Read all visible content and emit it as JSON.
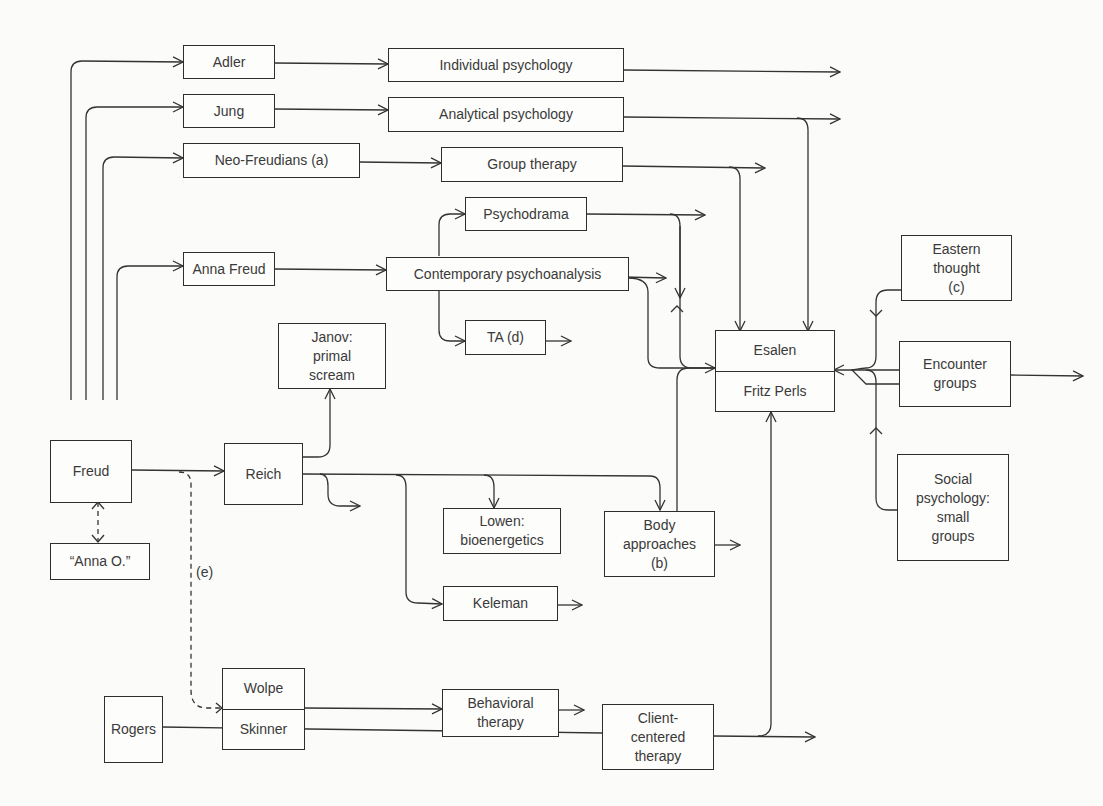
{
  "diagram": {
    "type": "flowchart",
    "nodes": {
      "adler": "Adler",
      "jung": "Jung",
      "neo_freudians": "Neo-Freudians (a)",
      "anna_freud": "Anna Freud",
      "individual_psychology": "Individual psychology",
      "analytical_psychology": "Analytical psychology",
      "group_therapy": "Group therapy",
      "psychodrama": "Psychodrama",
      "contemporary_psychoanalysis": "Contemporary psychoanalysis",
      "ta": "TA (d)",
      "janov": "Janov:\nprimal\nscream",
      "freud": "Freud",
      "anna_o": "“Anna O.”",
      "reich": "Reich",
      "lowen": "Lowen:\nbioenergetics",
      "body_approaches": "Body\napproaches\n(b)",
      "keleman": "Keleman",
      "wolpe": "Wolpe",
      "skinner": "Skinner",
      "behavioral_therapy": "Behavioral\ntherapy",
      "rogers": "Rogers",
      "client_centered": "Client-\ncentered\ntherapy",
      "esalen": "Esalen",
      "fritz_perls": "Fritz Perls",
      "eastern_thought": "Eastern\nthought\n(c)",
      "encounter_groups": "Encounter\ngroups",
      "social_psychology": "Social\npsychology:\nsmall\ngroups"
    },
    "labels": {
      "e": "(e)"
    },
    "edges": [
      {
        "from": "Freud",
        "to": "Adler"
      },
      {
        "from": "Freud",
        "to": "Jung"
      },
      {
        "from": "Freud",
        "to": "Neo-Freudians (a)"
      },
      {
        "from": "Freud",
        "to": "Anna Freud"
      },
      {
        "from": "Freud",
        "to": "Reich"
      },
      {
        "from": "Freud",
        "to": "“Anna O.”",
        "style": "dashed",
        "bidirectional": true
      },
      {
        "from": "Freud",
        "to": "Wolpe/Skinner",
        "style": "dashed",
        "label": "(e)"
      },
      {
        "from": "Adler",
        "to": "Individual psychology"
      },
      {
        "from": "Jung",
        "to": "Analytical psychology"
      },
      {
        "from": "Neo-Freudians (a)",
        "to": "Group therapy"
      },
      {
        "from": "Anna Freud",
        "to": "Contemporary psychoanalysis"
      },
      {
        "from": "Contemporary psychoanalysis",
        "to": "Psychodrama"
      },
      {
        "from": "Contemporary psychoanalysis",
        "to": "TA (d)"
      },
      {
        "from": "Analytical psychology",
        "to": "Esalen"
      },
      {
        "from": "Group therapy",
        "to": "Esalen"
      },
      {
        "from": "Psychodrama",
        "to": "Esalen"
      },
      {
        "from": "Contemporary psychoanalysis",
        "to": "Esalen"
      },
      {
        "from": "Reich",
        "to": "Janov: primal scream"
      },
      {
        "from": "Reich",
        "to": "Lowen: bioenergetics"
      },
      {
        "from": "Reich",
        "to": "Body approaches (b)"
      },
      {
        "from": "Reich",
        "to": "Keleman"
      },
      {
        "from": "Body approaches (b)",
        "to": "Esalen"
      },
      {
        "from": "Wolpe/Skinner",
        "to": "Behavioral therapy"
      },
      {
        "from": "Rogers",
        "to": "Client-centered therapy"
      },
      {
        "from": "Client-centered therapy",
        "to": "Fritz Perls"
      },
      {
        "from": "Eastern thought (c)",
        "to": "Esalen"
      },
      {
        "from": "Encounter groups",
        "to": "Esalen"
      },
      {
        "from": "Social psychology: small groups",
        "to": "Esalen"
      }
    ]
  }
}
